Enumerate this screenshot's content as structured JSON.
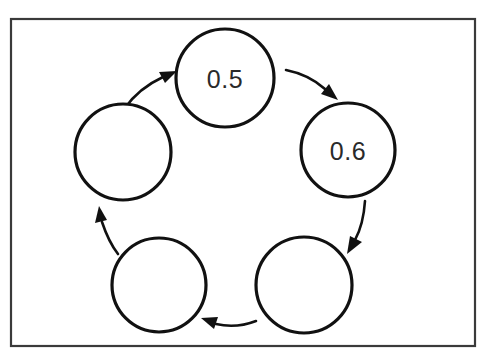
{
  "diagram": {
    "type": "cycle-diagram",
    "shape": "pentagon",
    "direction": "counter-clockwise",
    "node_count": 5,
    "arrow_count": 5,
    "canvas": {
      "width": 496,
      "height": 359
    },
    "colors": {
      "background": "#ffffff",
      "border": "#3a3a3a",
      "circle_stroke": "#111111",
      "arrow_stroke": "#111111",
      "label_text": "#2a2a2a"
    },
    "border": {
      "x": 11,
      "y": 19,
      "width": 464,
      "height": 327
    },
    "nodes": [
      {
        "id": "node-top",
        "label": "0.5",
        "cx": 225,
        "cy": 78,
        "r": 49,
        "position": "top",
        "has_label": true
      },
      {
        "id": "node-upper-right",
        "label": "0.6",
        "cx": 348,
        "cy": 150,
        "r": 47,
        "position": "upper-right",
        "has_label": true
      },
      {
        "id": "node-lower-right",
        "label": "",
        "cx": 304,
        "cy": 285,
        "r": 48,
        "position": "lower-right",
        "has_label": false
      },
      {
        "id": "node-lower-left",
        "label": "",
        "cx": 159,
        "cy": 285,
        "r": 47,
        "position": "lower-left",
        "has_label": false
      },
      {
        "id": "node-upper-left",
        "label": "",
        "cx": 123,
        "cy": 152,
        "r": 48,
        "position": "upper-left",
        "has_label": false
      }
    ],
    "arrows": [
      {
        "id": "arrow-top-to-upper-right",
        "from": "node-top",
        "to": "node-upper-right",
        "label": ""
      },
      {
        "id": "arrow-upper-right-to-lower-right",
        "from": "node-upper-right",
        "to": "node-lower-right",
        "label": ""
      },
      {
        "id": "arrow-lower-right-to-lower-left",
        "from": "node-lower-right",
        "to": "node-lower-left",
        "label": ""
      },
      {
        "id": "arrow-lower-left-to-upper-left",
        "from": "node-lower-left",
        "to": "node-upper-left",
        "label": ""
      },
      {
        "id": "arrow-upper-left-to-top",
        "from": "node-upper-left",
        "to": "node-top",
        "label": ""
      }
    ]
  }
}
